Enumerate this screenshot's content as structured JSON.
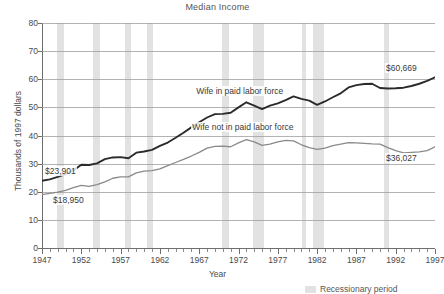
{
  "chart_data": {
    "type": "line",
    "title": "Median Income",
    "xlabel": "Year",
    "ylabel": "Thousands of 1997 dollars",
    "xlim": [
      1947,
      1997
    ],
    "ylim": [
      0,
      80
    ],
    "ytick_labels": [
      "0",
      "10",
      "20",
      "30",
      "40",
      "50",
      "60",
      "70",
      "80"
    ],
    "ytick_values": [
      0,
      10,
      20,
      30,
      40,
      50,
      60,
      70,
      80
    ],
    "xtick_labels": [
      "1947",
      "1952",
      "1957",
      "1962",
      "1967",
      "1972",
      "1977",
      "1982",
      "1987",
      "1992",
      "1997"
    ],
    "xtick_values": [
      1947,
      1952,
      1957,
      1962,
      1967,
      1972,
      1977,
      1982,
      1987,
      1992,
      1997
    ],
    "grid": true,
    "legend_position": "bottom-right",
    "x": [
      1947,
      1948,
      1949,
      1950,
      1951,
      1952,
      1953,
      1954,
      1955,
      1956,
      1957,
      1958,
      1959,
      1960,
      1961,
      1962,
      1963,
      1964,
      1965,
      1966,
      1967,
      1968,
      1969,
      1970,
      1971,
      1972,
      1973,
      1974,
      1975,
      1976,
      1977,
      1978,
      1979,
      1980,
      1981,
      1982,
      1983,
      1984,
      1985,
      1986,
      1987,
      1988,
      1989,
      1990,
      1991,
      1992,
      1993,
      1994,
      1995,
      1996,
      1997
    ],
    "series": [
      {
        "name": "Wife in paid labor force",
        "color": "#2b2b2b",
        "start_value": 23.901,
        "end_value": 60.669,
        "start_label": "$23,901",
        "end_label": "$60,669",
        "values": [
          23.9,
          24.4,
          25.3,
          26.3,
          27.6,
          29.6,
          29.5,
          30.1,
          31.6,
          32.2,
          32.3,
          31.9,
          33.9,
          34.3,
          34.9,
          36.3,
          37.5,
          39.2,
          41.0,
          42.9,
          44.7,
          46.4,
          47.6,
          47.7,
          48.1,
          50.0,
          51.8,
          50.6,
          49.4,
          50.6,
          51.4,
          52.6,
          53.9,
          53.0,
          52.4,
          50.9,
          52.1,
          53.6,
          55.0,
          57.1,
          57.9,
          58.3,
          58.4,
          56.9,
          56.7,
          56.8,
          57.0,
          57.6,
          58.4,
          59.4,
          60.7
        ]
      },
      {
        "name": "Wife not in paid labor force",
        "color": "#8a8a8a",
        "start_value": 18.95,
        "end_value": 36.027,
        "start_label": "$18,950",
        "end_label": "$36,027",
        "values": [
          19.0,
          19.4,
          19.9,
          20.5,
          21.5,
          22.3,
          21.9,
          22.5,
          23.5,
          24.8,
          25.3,
          25.3,
          26.7,
          27.3,
          27.5,
          28.1,
          29.3,
          30.4,
          31.5,
          32.7,
          34.0,
          35.5,
          36.1,
          36.2,
          36.0,
          37.4,
          38.5,
          37.7,
          36.5,
          36.9,
          37.7,
          38.3,
          38.1,
          36.7,
          35.7,
          35.1,
          35.5,
          36.4,
          36.9,
          37.5,
          37.4,
          37.2,
          37.0,
          36.9,
          35.7,
          34.6,
          33.8,
          34.0,
          34.2,
          34.6,
          36.0
        ]
      }
    ],
    "recession_bands": [
      {
        "start": 1948.9,
        "end": 1949.8
      },
      {
        "start": 1953.5,
        "end": 1954.4
      },
      {
        "start": 1957.6,
        "end": 1958.3
      },
      {
        "start": 1960.3,
        "end": 1961.1
      },
      {
        "start": 1969.9,
        "end": 1970.8
      },
      {
        "start": 1973.8,
        "end": 1975.2
      },
      {
        "start": 1980.1,
        "end": 1980.6
      },
      {
        "start": 1981.5,
        "end": 1982.9
      },
      {
        "start": 1990.5,
        "end": 1991.2
      }
    ],
    "annotations": [
      {
        "text": "Wife in paid labor force",
        "x": 1966.5,
        "y": 55.5
      },
      {
        "text": "Wife not in paid labor force",
        "x": 1966.0,
        "y": 42.5
      }
    ]
  },
  "legend": {
    "swatch_color": "#e2e2e2",
    "label": "Recessionary period"
  }
}
